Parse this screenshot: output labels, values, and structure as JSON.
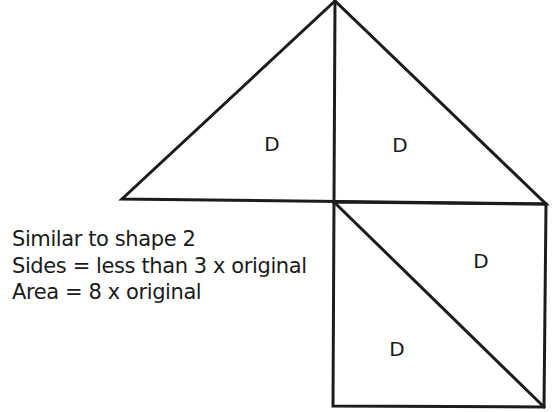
{
  "diagram": {
    "stroke_color": "#1c1c1c",
    "background_color": "#ffffff",
    "shapes": {
      "large_triangle": {
        "description": "Large isosceles triangle split by vertical altitude into two halves",
        "apex": [
          335,
          1
        ],
        "base_left": [
          122,
          199
        ],
        "base_right": [
          546,
          204
        ],
        "altitude_foot": [
          334,
          202
        ]
      },
      "square": {
        "description": "Square below right half, split by diagonal from top-left to bottom-right",
        "top_left": [
          334,
          202
        ],
        "top_right": [
          546,
          204
        ],
        "bottom_right": [
          544,
          407
        ],
        "bottom_left": [
          333,
          406
        ],
        "diagonal": [
          [
            334,
            202
          ],
          [
            544,
            407
          ]
        ]
      }
    },
    "regions": [
      {
        "label": "D",
        "position": "triangle-left-half",
        "x": 272,
        "y": 151
      },
      {
        "label": "D",
        "position": "triangle-right-half",
        "x": 400,
        "y": 152
      },
      {
        "label": "D",
        "position": "square-upper-right",
        "x": 481,
        "y": 268
      },
      {
        "label": "D",
        "position": "square-lower-left",
        "x": 397,
        "y": 356
      }
    ]
  },
  "caption": {
    "line1": "Similar to shape 2",
    "line2": "Sides = less than 3 x original",
    "line3": "Area = 8 x original"
  }
}
